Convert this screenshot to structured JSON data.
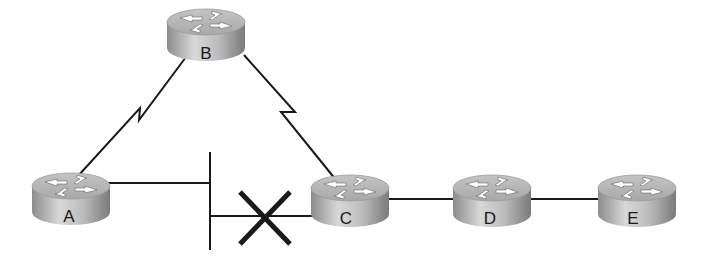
{
  "diagram": {
    "type": "network-topology",
    "routers": [
      {
        "id": "A",
        "label": "A",
        "cx": 71,
        "cy": 186
      },
      {
        "id": "B",
        "label": "B",
        "cx": 206,
        "cy": 22
      },
      {
        "id": "C",
        "label": "C",
        "cx": 350,
        "cy": 188
      },
      {
        "id": "D",
        "label": "D",
        "cx": 492,
        "cy": 188
      },
      {
        "id": "E",
        "label": "E",
        "cx": 637,
        "cy": 188
      }
    ],
    "links": [
      {
        "from": "A",
        "to": "B",
        "type": "serial"
      },
      {
        "from": "B",
        "to": "C",
        "type": "serial"
      },
      {
        "from": "A",
        "to": "ethernet-segment",
        "type": "ethernet"
      },
      {
        "from": "ethernet-segment",
        "to": "C",
        "type": "ethernet",
        "status": "failed"
      },
      {
        "from": "C",
        "to": "D",
        "type": "ethernet"
      },
      {
        "from": "D",
        "to": "E",
        "type": "ethernet"
      }
    ],
    "failure_marker": "X",
    "colors": {
      "line": "#1a1a1a",
      "router_body": "#9a9a9a",
      "router_top": "#b8b8b8"
    }
  }
}
